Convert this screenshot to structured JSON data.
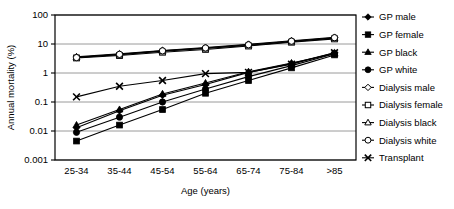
{
  "chart_data": {
    "type": "line",
    "title": "",
    "xlabel": "Age (years)",
    "ylabel": "Annual mortality (%)",
    "yscale": "log",
    "ylim": [
      0.001,
      100
    ],
    "yticks": [
      "0.001",
      "0.01",
      "0.1",
      "1",
      "10",
      "100"
    ],
    "ytick_values": [
      0.001,
      0.01,
      0.1,
      1,
      10,
      100
    ],
    "grid": "horizontal",
    "legend_position": "right-outside",
    "categories": [
      "25-34",
      "35-44",
      "45-54",
      "55-64",
      "65-74",
      "75-84",
      ">85"
    ],
    "series": [
      {
        "name": "GP male",
        "marker": "filled-diamond",
        "values": [
          0.013,
          0.05,
          0.17,
          0.4,
          1.05,
          2.1,
          5.0
        ]
      },
      {
        "name": "GP female",
        "marker": "filled-square",
        "values": [
          0.0045,
          0.016,
          0.055,
          0.2,
          0.55,
          1.5,
          4.2
        ]
      },
      {
        "name": "GP black",
        "marker": "filled-triangle",
        "values": [
          0.016,
          0.055,
          0.19,
          0.45,
          1.1,
          2.2,
          4.6
        ]
      },
      {
        "name": "GP white",
        "marker": "filled-circle",
        "values": [
          0.009,
          0.03,
          0.1,
          0.28,
          0.75,
          1.8,
          4.6
        ]
      },
      {
        "name": "Dialysis male",
        "marker": "open-diamond",
        "values": [
          3.6,
          4.6,
          6.0,
          7.6,
          9.8,
          13.0,
          17.0
        ]
      },
      {
        "name": "Dialysis female",
        "marker": "open-square",
        "values": [
          3.3,
          4.0,
          5.2,
          6.5,
          8.5,
          11.5,
          15.0
        ]
      },
      {
        "name": "Dialysis black",
        "marker": "open-triangle",
        "values": [
          3.5,
          4.3,
          5.6,
          7.0,
          9.0,
          12.0,
          16.0
        ]
      },
      {
        "name": "Dialysis white",
        "marker": "open-circle",
        "values": [
          3.4,
          4.4,
          5.8,
          7.3,
          9.4,
          12.5,
          16.5
        ]
      },
      {
        "name": "Transplant",
        "marker": "cross-x",
        "values": [
          0.15,
          0.35,
          0.55,
          0.95,
          1.05,
          2.0,
          5.0
        ]
      }
    ]
  },
  "axes": {
    "ylabel": "Annual mortality (%)",
    "xlabel": "Age (years)"
  },
  "legend": {
    "items": [
      {
        "label": "GP male",
        "marker": "filled-diamond"
      },
      {
        "label": "GP female",
        "marker": "filled-square"
      },
      {
        "label": "GP black",
        "marker": "filled-triangle"
      },
      {
        "label": "GP white",
        "marker": "filled-circle"
      },
      {
        "label": "Dialysis male",
        "marker": "open-diamond"
      },
      {
        "label": "Dialysis female",
        "marker": "open-square"
      },
      {
        "label": "Dialysis black",
        "marker": "open-triangle"
      },
      {
        "label": "Dialysis white",
        "marker": "open-circle"
      },
      {
        "label": "Transplant",
        "marker": "cross-x"
      }
    ]
  },
  "colors": {
    "line": "#000000",
    "grid": "#808080",
    "axis": "#000000",
    "background": "#ffffff",
    "marker_fill": "#000000",
    "marker_open_fill": "#ffffff"
  }
}
